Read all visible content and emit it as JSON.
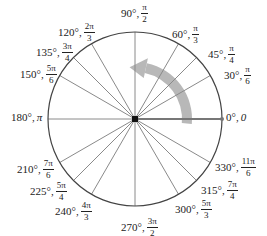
{
  "diagram": {
    "center": [
      135,
      119
    ],
    "radius": 87,
    "colors": {
      "circle": "#444444",
      "spoke": "#8a8a8a",
      "initial_ray": "#777777",
      "center_point": "#111111",
      "arrow": "#b8b8b8"
    },
    "rotation_arrow": {
      "direction": "counterclockwise",
      "label": ""
    },
    "angles": [
      {
        "deg": "0°",
        "rad_plain": "0",
        "x": 226,
        "y": 112
      },
      {
        "deg": "30°",
        "num": "π",
        "den": "6",
        "x": 224,
        "y": 65
      },
      {
        "deg": "45°",
        "num": "π",
        "den": "4",
        "x": 208,
        "y": 44
      },
      {
        "deg": "60°",
        "num": "π",
        "den": "3",
        "x": 172,
        "y": 24
      },
      {
        "deg": "90°",
        "num": "π",
        "den": "2",
        "x": 121,
        "y": 3
      },
      {
        "deg": "120°",
        "num": "2π",
        "den": "3",
        "x": 58,
        "y": 22
      },
      {
        "deg": "135°",
        "num": "3π",
        "den": "4",
        "x": 36,
        "y": 42
      },
      {
        "deg": "150°",
        "num": "5π",
        "den": "6",
        "x": 20,
        "y": 64
      },
      {
        "deg": "180°",
        "rad_plain": "π",
        "x": 11,
        "y": 112
      },
      {
        "deg": "210°",
        "num": "7π",
        "den": "6",
        "x": 17,
        "y": 159
      },
      {
        "deg": "225°",
        "num": "5π",
        "den": "4",
        "x": 30,
        "y": 181
      },
      {
        "deg": "240°",
        "num": "4π",
        "den": "3",
        "x": 55,
        "y": 201
      },
      {
        "deg": "270°",
        "num": "3π",
        "den": "2",
        "x": 121,
        "y": 217
      },
      {
        "deg": "300°",
        "num": "5π",
        "den": "3",
        "x": 175,
        "y": 199
      },
      {
        "deg": "315°",
        "num": "7π",
        "den": "4",
        "x": 201,
        "y": 180
      },
      {
        "deg": "330°",
        "num": "11π",
        "den": "6",
        "x": 215,
        "y": 157
      }
    ]
  }
}
